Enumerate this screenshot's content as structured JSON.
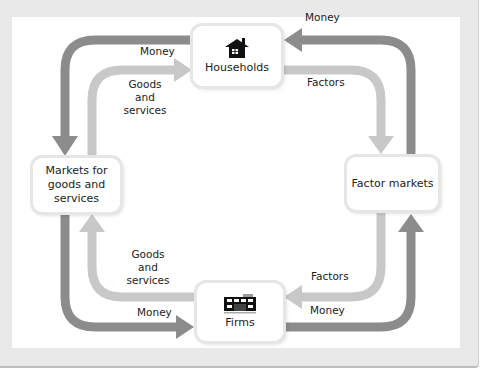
{
  "diagram": {
    "colors": {
      "money_flow": "#8c8c8c",
      "goods_factors_flow": "#c8c8c8",
      "frame": "#e9e9e9",
      "box": "#ffffff"
    },
    "nodes": {
      "households": {
        "label": "Households",
        "icon": "house-icon"
      },
      "firms": {
        "label": "Firms",
        "icon": "factory-icon"
      },
      "goods_markets": {
        "label": "Markets for\ngoods and\nservices"
      },
      "factor_markets": {
        "label": "Factor markets"
      }
    },
    "flows": {
      "top_left_money": "Money",
      "top_left_goods": "Goods\nand\nservices",
      "top_right_money": "Money",
      "top_right_factors": "Factors",
      "bottom_left_goods": "Goods\nand\nservices",
      "bottom_left_money": "Money",
      "bottom_right_factors": "Factors",
      "bottom_right_money": "Money"
    },
    "edges": [
      {
        "from": "households",
        "to": "goods_markets",
        "label": "Money",
        "type": "money"
      },
      {
        "from": "goods_markets",
        "to": "households",
        "label": "Goods and services",
        "type": "goods"
      },
      {
        "from": "factor_markets",
        "to": "households",
        "label": "Money",
        "type": "money"
      },
      {
        "from": "households",
        "to": "factor_markets",
        "label": "Factors",
        "type": "factors"
      },
      {
        "from": "firms",
        "to": "goods_markets",
        "label": "Goods and services",
        "type": "goods"
      },
      {
        "from": "goods_markets",
        "to": "firms",
        "label": "Money",
        "type": "money"
      },
      {
        "from": "factor_markets",
        "to": "firms",
        "label": "Factors",
        "type": "factors"
      },
      {
        "from": "firms",
        "to": "factor_markets",
        "label": "Money",
        "type": "money"
      }
    ]
  }
}
